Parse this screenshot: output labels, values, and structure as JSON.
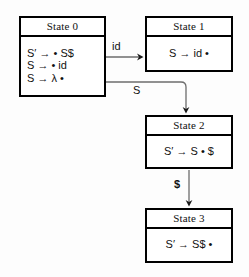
{
  "diagram": {
    "states": [
      {
        "id": "state0",
        "header": "State 0",
        "rules": [
          "S′ → • S$",
          "S → • id",
          "S → λ •"
        ]
      },
      {
        "id": "state1",
        "header": "State 1",
        "rules": [
          "S → id •"
        ]
      },
      {
        "id": "state2",
        "header": "State 2",
        "rules": [
          "S′ → S • $"
        ]
      },
      {
        "id": "state3",
        "header": "State 3",
        "rules": [
          "S′ → S$ •"
        ]
      }
    ],
    "edges": [
      {
        "id": "edge-id",
        "from": "State 0",
        "to": "State 1",
        "label": "id"
      },
      {
        "id": "edge-s",
        "from": "State 0",
        "to": "State 2",
        "label": "S"
      },
      {
        "id": "edge-dollar",
        "from": "State 2",
        "to": "State 3",
        "label": "$"
      }
    ],
    "colors": {
      "box_border": "#000000",
      "box_fill": "#ffffff",
      "edge_stroke": "#6d6d6d",
      "arrow_head": "#1a1a1a",
      "text": "#111111",
      "background": "#fdfdfd"
    }
  }
}
